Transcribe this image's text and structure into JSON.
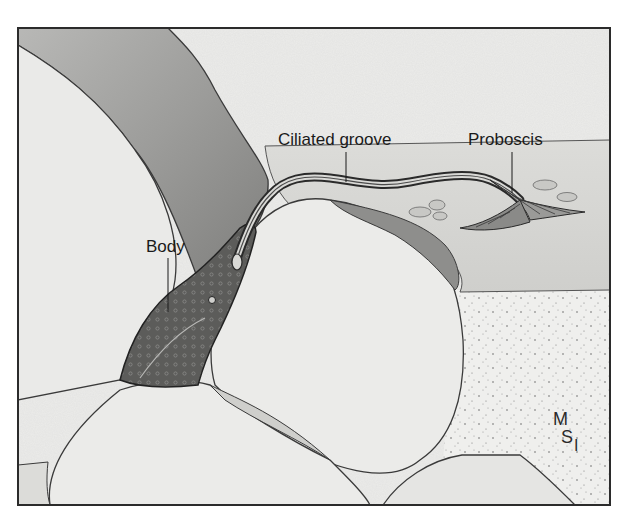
{
  "figure": {
    "labels": {
      "body": "Body",
      "ciliated_groove": "Ciliated groove",
      "proboscis": "Proboscis"
    },
    "signature": {
      "line1": "M",
      "line2": "S",
      "line3": "I"
    },
    "colors": {
      "frame": "#2b2b2b",
      "grain_fill": "#e9e9e7",
      "grain_outline": "#3a3a3a",
      "dark_grain": "#9a9a98",
      "sediment": "#d6d6d3",
      "sand_background": "#eeeeec",
      "body_fill": "#5a5a58"
    }
  }
}
